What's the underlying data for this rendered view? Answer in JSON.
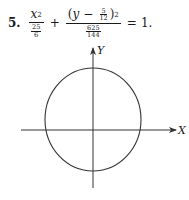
{
  "problem": {
    "number": "5.",
    "equation": {
      "term1": {
        "numerator_var": "x",
        "numerator_exp": "2",
        "denominator": {
          "num": "25",
          "den": "6"
        }
      },
      "plus": "+",
      "term2": {
        "open_paren": "(",
        "var": "y",
        "minus": "−",
        "shift": {
          "num": "5",
          "den": "12"
        },
        "close_paren": ")",
        "exp": "2",
        "denominator": {
          "num": "625",
          "den": "144"
        }
      },
      "equals": "=",
      "rhs": "1."
    }
  },
  "graph": {
    "x_axis_label": "X",
    "y_axis_label": "Y",
    "curve": "ellipse",
    "colors": {
      "stroke": "#333333",
      "background": "#ffffff"
    }
  }
}
